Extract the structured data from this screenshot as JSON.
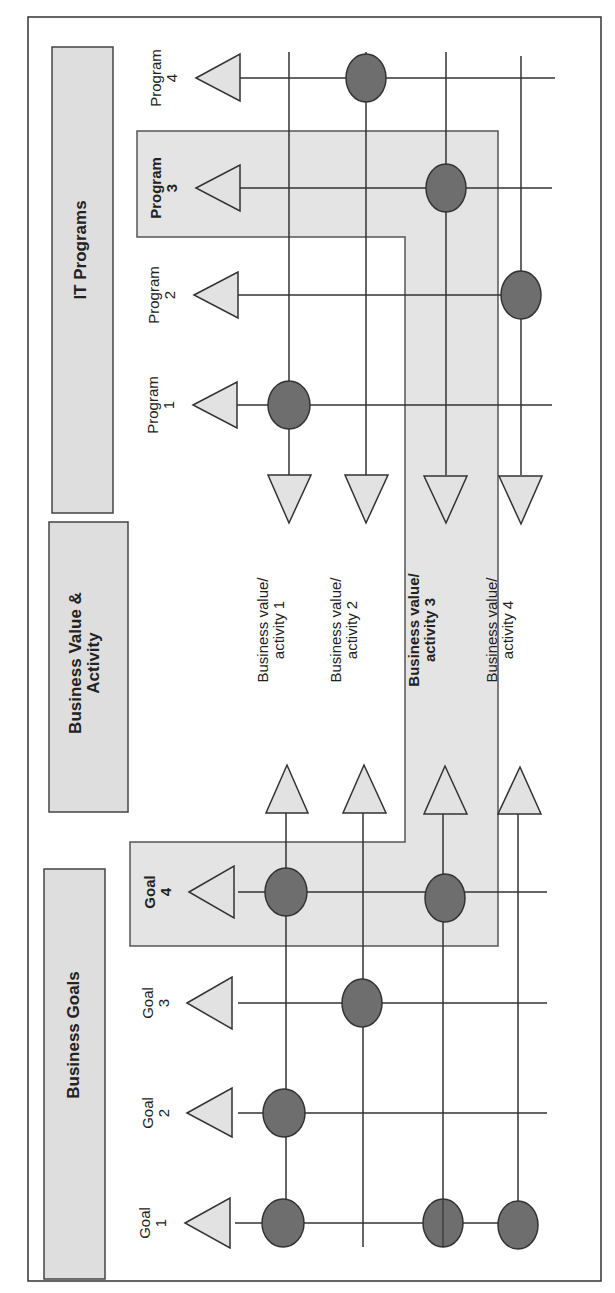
{
  "diagram": {
    "orientation": "rotated-90-ccw",
    "colors": {
      "line": "#333333",
      "box_fill": "#dedede",
      "highlight_fill": "#e4e4e4",
      "node_fill": "#6e6e6e",
      "triangle_fill": "#e2e2e2"
    },
    "sections": {
      "it_programs": "IT Programs",
      "business_value": "Business Value &\nActivity",
      "business_goals": "Business Goals"
    },
    "programs": [
      {
        "label": "Program 1",
        "line1": "Program",
        "line2": "1",
        "highlighted": false
      },
      {
        "label": "Program 2",
        "line1": "Program",
        "line2": "2",
        "highlighted": false
      },
      {
        "label": "Program 3",
        "line1": "Program",
        "line2": "3",
        "highlighted": true
      },
      {
        "label": "Program 4",
        "line1": "Program",
        "line2": "4",
        "highlighted": false
      }
    ],
    "business_values": [
      {
        "line1": "Business value/",
        "line2": "activity 1",
        "highlighted": false
      },
      {
        "line1": "Business value/",
        "line2": "activity 2",
        "highlighted": false
      },
      {
        "line1": "Business value/",
        "line2": "activity 3",
        "highlighted": true
      },
      {
        "line1": "Business value/",
        "line2": "activity 4",
        "highlighted": false
      }
    ],
    "goals": [
      {
        "line1": "Goal",
        "line2": "1",
        "highlighted": false
      },
      {
        "line1": "Goal",
        "line2": "2",
        "highlighted": false
      },
      {
        "line1": "Goal",
        "line2": "3",
        "highlighted": false
      },
      {
        "line1": "Goal",
        "line2": "4",
        "highlighted": true
      }
    ],
    "program_to_value_links": [
      {
        "program": "Program 1",
        "value": "Business value/activity 1"
      },
      {
        "program": "Program 2",
        "value": "Business value/activity 4"
      },
      {
        "program": "Program 3",
        "value": "Business value/activity 3"
      },
      {
        "program": "Program 4",
        "value": "Business value/activity 2"
      }
    ],
    "goal_to_value_links": [
      {
        "goal": "Goal 1",
        "value": "Business value/activity 1"
      },
      {
        "goal": "Goal 1",
        "value": "Business value/activity 3"
      },
      {
        "goal": "Goal 1",
        "value": "Business value/activity 4"
      },
      {
        "goal": "Goal 2",
        "value": "Business value/activity 1"
      },
      {
        "goal": "Goal 3",
        "value": "Business value/activity 2"
      },
      {
        "goal": "Goal 4",
        "value": "Business value/activity 1"
      },
      {
        "goal": "Goal 4",
        "value": "Business value/activity 3"
      }
    ]
  }
}
